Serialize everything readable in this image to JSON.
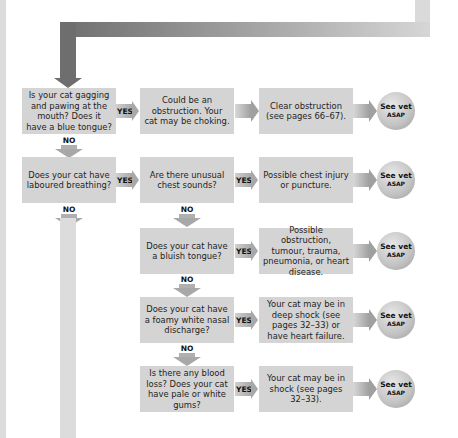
{
  "rows": [
    {
      "question": "Is your cat gagging and pawing at the mouth? Does it have a blue tongue?",
      "yes": "YES",
      "result": "Could be an obstruction. Your cat may be choking.",
      "action": "Clear obstruction (see pages 66–67).",
      "vet": {
        "line1": "See vet",
        "line2": "ASAP"
      },
      "no": "NO"
    },
    {
      "question": "Does your cat have laboured breathing?",
      "yes": "YES",
      "no": "NO"
    },
    {
      "question": "Are there unusual chest sounds?",
      "yes": "YES",
      "result": "Possible chest injury or puncture.",
      "vet": {
        "line1": "See vet",
        "line2": "ASAP"
      },
      "no": "NO"
    },
    {
      "question": "Does your cat have a bluish tongue?",
      "yes": "YES",
      "result": "Possible obstruction, tumour, trauma, pneumonia, or heart disease.",
      "vet": {
        "line1": "See vet",
        "line2": "ASAP"
      },
      "no": "NO"
    },
    {
      "question": "Does your cat have a foamy white nasal discharge?",
      "yes": "YES",
      "result": "Your cat may be in deep shock (see pages 32–33) or have heart failure.",
      "vet": {
        "line1": "See vet",
        "line2": "ASAP"
      },
      "no": "NO"
    },
    {
      "question": "Is there any blood loss? Does your cat have pale or white gums?",
      "yes": "YES",
      "result": "Your cat may be in shock (see pages 32–33).",
      "vet": {
        "line1": "See vet",
        "line2": "ASAP"
      }
    }
  ],
  "colors": {
    "box": "#d4d4d4",
    "arrow_dark": "#6e6e6e",
    "arrow_light": "#dadada"
  }
}
